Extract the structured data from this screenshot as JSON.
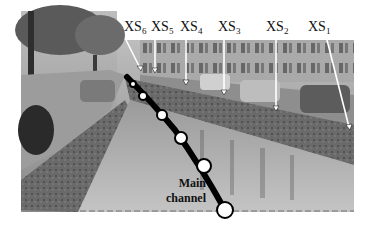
{
  "figure": {
    "photo_tone": "grayscale",
    "colors": {
      "line": "#000000",
      "marker_fill": "#ffffff",
      "arrow": "#ffffff",
      "background": "#ffffff"
    }
  },
  "cross_sections": [
    {
      "id": "XS6",
      "base": "XS",
      "sub": "6"
    },
    {
      "id": "XS5",
      "base": "XS",
      "sub": "5"
    },
    {
      "id": "XS4",
      "base": "XS",
      "sub": "4"
    },
    {
      "id": "XS3",
      "base": "XS",
      "sub": "3"
    },
    {
      "id": "XS2",
      "base": "XS",
      "sub": "2"
    },
    {
      "id": "XS1",
      "base": "XS",
      "sub": "1"
    }
  ],
  "channel_label": {
    "line1": "Main",
    "line2": "channel"
  },
  "markers_count": 6
}
